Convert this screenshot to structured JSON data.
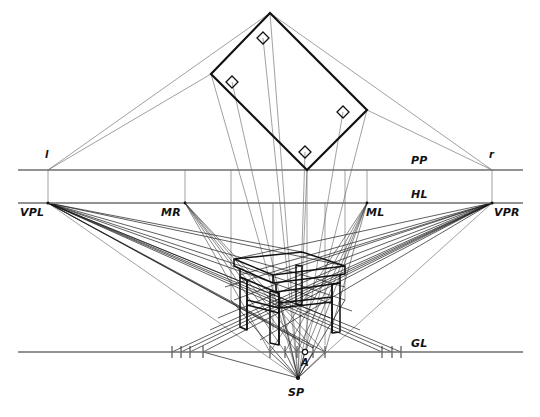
{
  "diagram": {
    "type": "technical-perspective-drawing",
    "canvas": {
      "width": 540,
      "height": 417
    },
    "colors": {
      "ink": "#111111",
      "construction": "#4a4a4a",
      "reference_line": "#6e6e6e",
      "background": "#ffffff"
    },
    "labels": {
      "pp": "PP",
      "hl": "HL",
      "gl": "GL",
      "vpl": "VPL",
      "vpr": "VPR",
      "mr": "MR",
      "ml": "ML",
      "sp": "SP",
      "point_a": "A",
      "left_trace": "l",
      "right_trace": "r"
    },
    "label_positions": {
      "pp": {
        "x": 411,
        "y": 155
      },
      "hl": {
        "x": 411,
        "y": 189
      },
      "gl": {
        "x": 411,
        "y": 338
      },
      "vpl": {
        "x": 20,
        "y": 207
      },
      "vpr": {
        "x": 494,
        "y": 207
      },
      "mr": {
        "x": 161,
        "y": 207
      },
      "ml": {
        "x": 366,
        "y": 207
      },
      "sp": {
        "x": 288,
        "y": 387
      },
      "point_a": {
        "x": 301,
        "y": 358
      },
      "left_trace": {
        "x": 45,
        "y": 152
      },
      "right_trace": {
        "x": 489,
        "y": 152
      }
    },
    "reference_lines": {
      "pp_y": 170,
      "hl_y": 203,
      "gl_y": 352,
      "line_x_start": 18,
      "line_x_end": 523
    },
    "key_points": {
      "vpl": {
        "x": 48,
        "y": 203
      },
      "vpr": {
        "x": 492,
        "y": 203
      },
      "mr": {
        "x": 185,
        "y": 203
      },
      "ml": {
        "x": 367,
        "y": 203
      },
      "l": {
        "x": 48,
        "y": 170
      },
      "r": {
        "x": 492,
        "y": 170
      },
      "sp": {
        "x": 298,
        "y": 378
      },
      "a": {
        "x": 305,
        "y": 352
      },
      "plan_contact": {
        "x": 307,
        "y": 170
      }
    },
    "plan_view": {
      "description": "Rotated rectangular table top seen in plan with four leg squares",
      "vertices": [
        {
          "x": 270,
          "y": 13
        },
        {
          "x": 367,
          "y": 110
        },
        {
          "x": 307,
          "y": 170
        },
        {
          "x": 211,
          "y": 74
        }
      ],
      "legs": [
        {
          "x": 263,
          "y": 38
        },
        {
          "x": 343,
          "y": 112
        },
        {
          "x": 305,
          "y": 152
        },
        {
          "x": 232,
          "y": 82
        }
      ]
    },
    "perspective_table": {
      "description": "Table drawn in two-point perspective between HL and GL",
      "top_face": [
        {
          "x": 234,
          "y": 259
        },
        {
          "x": 302,
          "y": 252
        },
        {
          "x": 345,
          "y": 266
        },
        {
          "x": 273,
          "y": 275
        }
      ]
    },
    "gl_ticks": [
      172,
      181,
      190,
      203,
      270,
      285,
      297,
      305,
      313,
      325,
      382,
      392,
      401
    ],
    "notes": {
      "measurement": "Measuring points MR and ML lie on the horizon line",
      "station": "SP is the station point below the ground line"
    }
  }
}
